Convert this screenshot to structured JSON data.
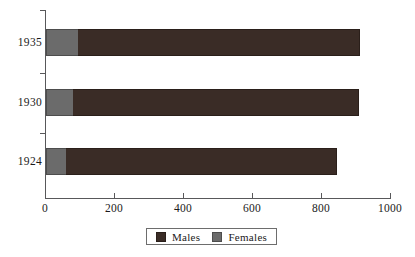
{
  "chart_data": {
    "type": "bar",
    "orientation": "horizontal",
    "stacked": true,
    "title": "",
    "subtitle": "",
    "xlabel": "",
    "ylabel": "",
    "categories": [
      "1935",
      "1930",
      "1924"
    ],
    "series": [
      {
        "name": "Males",
        "color": "#3a2c26",
        "values": [
          820,
          832,
          788
        ]
      },
      {
        "name": "Females",
        "color": "#6b6b6b",
        "values": [
          94,
          78,
          58
        ]
      }
    ],
    "totals": [
      914,
      910,
      846
    ],
    "xlim": [
      0,
      1000
    ],
    "xticks": [
      0,
      200,
      400,
      600,
      800,
      1000
    ],
    "xtick_labels": [
      "0",
      "200",
      "400",
      "600",
      "800",
      "1000"
    ],
    "grid": false,
    "legend": {
      "position": "bottom-center",
      "boxed": true,
      "entries": [
        {
          "label": "Males",
          "swatch": "males-swatch-icon",
          "color": "#3a2c26"
        },
        {
          "label": "Females",
          "swatch": "females-swatch-icon",
          "color": "#6b6b6b"
        }
      ]
    }
  }
}
